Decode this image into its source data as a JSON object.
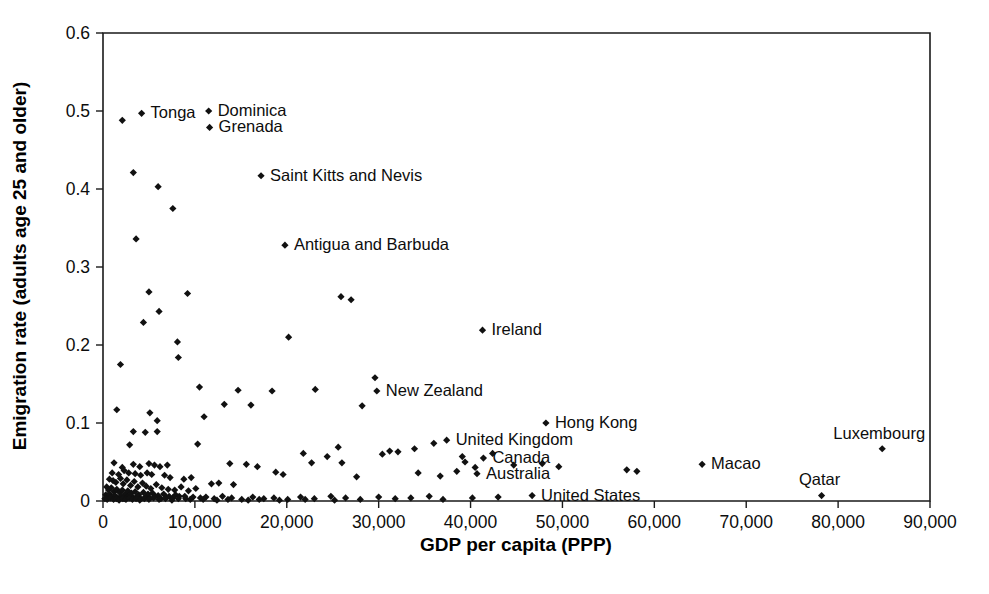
{
  "chart_data": {
    "type": "scatter",
    "title": "",
    "xlabel": "GDP per capita (PPP)",
    "ylabel": "Emigration rate (adults age 25 and older)",
    "xlim": [
      0,
      90000
    ],
    "ylim": [
      0,
      0.6
    ],
    "grid": false,
    "legend": "none",
    "xticks": [
      0,
      10000,
      20000,
      30000,
      40000,
      50000,
      60000,
      70000,
      80000,
      90000
    ],
    "xtick_labels": [
      "0",
      "10,000",
      "20,000",
      "30,000",
      "40,000",
      "50,000",
      "60,000",
      "70,000",
      "80,000",
      "90,000"
    ],
    "yticks": [
      0,
      0.1,
      0.2,
      0.3,
      0.4,
      0.5,
      0.6
    ],
    "ytick_labels": [
      "0",
      "0.1",
      "0.2",
      "0.3",
      "0.4",
      "0.5",
      "0.6"
    ],
    "annotations": [
      {
        "label": "Tonga",
        "x": 4200,
        "y": 0.497,
        "dx": 9,
        "dy": 5
      },
      {
        "label": "Dominica",
        "x": 11500,
        "y": 0.5,
        "dx": 9,
        "dy": 5
      },
      {
        "label": "Grenada",
        "x": 11600,
        "y": 0.479,
        "dx": 9,
        "dy": 5
      },
      {
        "label": "Saint Kitts and Nevis",
        "x": 17200,
        "y": 0.417,
        "dx": 9,
        "dy": 5
      },
      {
        "label": "Antigua and Barbuda",
        "x": 19800,
        "y": 0.328,
        "dx": 9,
        "dy": 5
      },
      {
        "label": "Ireland",
        "x": 41300,
        "y": 0.219,
        "dx": 9,
        "dy": 5
      },
      {
        "label": "New Zealand",
        "x": 29800,
        "y": 0.141,
        "dx": 9,
        "dy": 5
      },
      {
        "label": "Hong Kong",
        "x": 48200,
        "y": 0.1,
        "dx": 9,
        "dy": 5
      },
      {
        "label": "United Kingdom",
        "x": 37400,
        "y": 0.078,
        "dx": 9,
        "dy": 5
      },
      {
        "label": "Canada",
        "x": 41400,
        "y": 0.055,
        "dx": 9,
        "dy": 5
      },
      {
        "label": "Macao",
        "x": 65200,
        "y": 0.047,
        "dx": 9,
        "dy": 5
      },
      {
        "label": "Luxembourg",
        "x": 84800,
        "y": 0.067,
        "dx": -3,
        "dy": -10
      },
      {
        "label": "Australia",
        "x": 40700,
        "y": 0.035,
        "dx": 9,
        "dy": 5
      },
      {
        "label": "United States",
        "x": 46700,
        "y": 0.007,
        "dx": 9,
        "dy": 5
      },
      {
        "label": "Qatar",
        "x": 78200,
        "y": 0.007,
        "dx": -2,
        "dy": -11
      }
    ],
    "points": [
      [
        2100,
        0.488
      ],
      [
        4200,
        0.497
      ],
      [
        11500,
        0.5
      ],
      [
        11600,
        0.479
      ],
      [
        3300,
        0.421
      ],
      [
        6000,
        0.403
      ],
      [
        17200,
        0.417
      ],
      [
        7600,
        0.375
      ],
      [
        3600,
        0.336
      ],
      [
        19800,
        0.328
      ],
      [
        5000,
        0.268
      ],
      [
        9200,
        0.266
      ],
      [
        25900,
        0.262
      ],
      [
        27000,
        0.258
      ],
      [
        4400,
        0.229
      ],
      [
        6100,
        0.243
      ],
      [
        1900,
        0.175
      ],
      [
        41300,
        0.219
      ],
      [
        8100,
        0.204
      ],
      [
        20200,
        0.21
      ],
      [
        8200,
        0.184
      ],
      [
        10500,
        0.146
      ],
      [
        14700,
        0.142
      ],
      [
        18400,
        0.141
      ],
      [
        1500,
        0.117
      ],
      [
        5100,
        0.113
      ],
      [
        5900,
        0.103
      ],
      [
        11000,
        0.108
      ],
      [
        29800,
        0.141
      ],
      [
        29600,
        0.158
      ],
      [
        28200,
        0.122
      ],
      [
        3300,
        0.089
      ],
      [
        4600,
        0.088
      ],
      [
        5900,
        0.089
      ],
      [
        13200,
        0.124
      ],
      [
        16100,
        0.123
      ],
      [
        23100,
        0.143
      ],
      [
        48200,
        0.1
      ],
      [
        2900,
        0.072
      ],
      [
        10300,
        0.073
      ],
      [
        21800,
        0.061
      ],
      [
        25600,
        0.069
      ],
      [
        37400,
        0.078
      ],
      [
        36000,
        0.074
      ],
      [
        33900,
        0.067
      ],
      [
        1200,
        0.049
      ],
      [
        2100,
        0.043
      ],
      [
        3300,
        0.047
      ],
      [
        4000,
        0.044
      ],
      [
        5000,
        0.048
      ],
      [
        5600,
        0.046
      ],
      [
        6200,
        0.044
      ],
      [
        7000,
        0.046
      ],
      [
        13800,
        0.048
      ],
      [
        15600,
        0.047
      ],
      [
        16800,
        0.044
      ],
      [
        22700,
        0.049
      ],
      [
        24400,
        0.057
      ],
      [
        26000,
        0.049
      ],
      [
        30400,
        0.06
      ],
      [
        31200,
        0.064
      ],
      [
        32100,
        0.063
      ],
      [
        39100,
        0.057
      ],
      [
        39400,
        0.05
      ],
      [
        41400,
        0.055
      ],
      [
        42400,
        0.061
      ],
      [
        44700,
        0.046
      ],
      [
        47800,
        0.048
      ],
      [
        49600,
        0.044
      ],
      [
        57000,
        0.04
      ],
      [
        58100,
        0.038
      ],
      [
        65200,
        0.047
      ],
      [
        84800,
        0.067
      ],
      [
        1000,
        0.036
      ],
      [
        1700,
        0.034
      ],
      [
        2300,
        0.039
      ],
      [
        2800,
        0.036
      ],
      [
        3500,
        0.035
      ],
      [
        4100,
        0.033
      ],
      [
        4800,
        0.036
      ],
      [
        5300,
        0.034
      ],
      [
        6700,
        0.033
      ],
      [
        7300,
        0.03
      ],
      [
        8800,
        0.028
      ],
      [
        9600,
        0.03
      ],
      [
        11800,
        0.022
      ],
      [
        12600,
        0.023
      ],
      [
        14200,
        0.021
      ],
      [
        18800,
        0.037
      ],
      [
        19600,
        0.034
      ],
      [
        27600,
        0.031
      ],
      [
        34300,
        0.036
      ],
      [
        36700,
        0.032
      ],
      [
        38500,
        0.038
      ],
      [
        40700,
        0.035
      ],
      [
        40500,
        0.043
      ],
      [
        700,
        0.028
      ],
      [
        1100,
        0.026
      ],
      [
        1400,
        0.024
      ],
      [
        1900,
        0.029
      ],
      [
        2200,
        0.022
      ],
      [
        2600,
        0.027
      ],
      [
        3000,
        0.02
      ],
      [
        3400,
        0.025
      ],
      [
        3800,
        0.018
      ],
      [
        4300,
        0.023
      ],
      [
        4700,
        0.019
      ],
      [
        5200,
        0.016
      ],
      [
        5800,
        0.021
      ],
      [
        6400,
        0.017
      ],
      [
        7100,
        0.015
      ],
      [
        7800,
        0.014
      ],
      [
        8500,
        0.018
      ],
      [
        9300,
        0.013
      ],
      [
        10100,
        0.016
      ],
      [
        400,
        0.018
      ],
      [
        600,
        0.014
      ],
      [
        900,
        0.017
      ],
      [
        1200,
        0.012
      ],
      [
        1500,
        0.015
      ],
      [
        1800,
        0.011
      ],
      [
        2100,
        0.014
      ],
      [
        2400,
        0.009
      ],
      [
        2700,
        0.013
      ],
      [
        3100,
        0.01
      ],
      [
        3500,
        0.012
      ],
      [
        3900,
        0.008
      ],
      [
        4400,
        0.011
      ],
      [
        4900,
        0.009
      ],
      [
        5400,
        0.01
      ],
      [
        6000,
        0.007
      ],
      [
        6600,
        0.009
      ],
      [
        7200,
        0.006
      ],
      [
        7900,
        0.008
      ],
      [
        300,
        0.008
      ],
      [
        500,
        0.006
      ],
      [
        700,
        0.009
      ],
      [
        1000,
        0.005
      ],
      [
        1300,
        0.007
      ],
      [
        1600,
        0.004
      ],
      [
        2000,
        0.006
      ],
      [
        2300,
        0.003
      ],
      [
        2600,
        0.005
      ],
      [
        2900,
        0.007
      ],
      [
        3300,
        0.004
      ],
      [
        3700,
        0.006
      ],
      [
        4100,
        0.003
      ],
      [
        4600,
        0.005
      ],
      [
        5100,
        0.004
      ],
      [
        5700,
        0.006
      ],
      [
        6300,
        0.003
      ],
      [
        6900,
        0.005
      ],
      [
        7600,
        0.004
      ],
      [
        8300,
        0.006
      ],
      [
        9000,
        0.003
      ],
      [
        9800,
        0.005
      ],
      [
        10600,
        0.004
      ],
      [
        200,
        0.003
      ],
      [
        450,
        0.002
      ],
      [
        800,
        0.004
      ],
      [
        1150,
        0.002
      ],
      [
        1450,
        0.003
      ],
      [
        1750,
        0.001
      ],
      [
        2150,
        0.003
      ],
      [
        2500,
        0.002
      ],
      [
        2850,
        0.004
      ],
      [
        3200,
        0.002
      ],
      [
        3600,
        0.003
      ],
      [
        4000,
        0.001
      ],
      [
        4500,
        0.003
      ],
      [
        5000,
        0.002
      ],
      [
        5500,
        0.004
      ],
      [
        6100,
        0.002
      ],
      [
        6800,
        0.003
      ],
      [
        7500,
        0.001
      ],
      [
        8200,
        0.003
      ],
      [
        11200,
        0.005
      ],
      [
        12100,
        0.003
      ],
      [
        13000,
        0.006
      ],
      [
        14000,
        0.004
      ],
      [
        15100,
        0.002
      ],
      [
        16300,
        0.005
      ],
      [
        17500,
        0.003
      ],
      [
        18600,
        0.004
      ],
      [
        20100,
        0.002
      ],
      [
        21500,
        0.005
      ],
      [
        23000,
        0.003
      ],
      [
        24800,
        0.006
      ],
      [
        26400,
        0.004
      ],
      [
        28000,
        0.002
      ],
      [
        30000,
        0.005
      ],
      [
        31800,
        0.003
      ],
      [
        33500,
        0.004
      ],
      [
        35500,
        0.006
      ],
      [
        37000,
        0.002
      ],
      [
        40200,
        0.004
      ],
      [
        43000,
        0.005
      ],
      [
        46700,
        0.007
      ],
      [
        78200,
        0.007
      ],
      [
        8900,
        0.006
      ],
      [
        9500,
        0.002
      ],
      [
        10900,
        0.002
      ],
      [
        12400,
        0.001
      ],
      [
        13600,
        0.002
      ],
      [
        15800,
        0.001
      ],
      [
        17000,
        0.002
      ],
      [
        19200,
        0.001
      ],
      [
        22000,
        0.002
      ],
      [
        25200,
        0.001
      ]
    ]
  }
}
